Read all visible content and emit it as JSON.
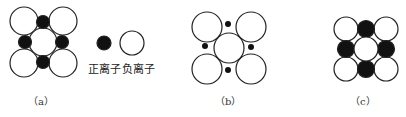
{
  "legend": {
    "cation_label": "正离子",
    "anion_label": "负离子"
  },
  "panels": [
    {
      "id": "a",
      "caption": "（a）",
      "description": "cations touch anions; stable packing"
    },
    {
      "id": "b",
      "caption": "（b）",
      "description": "small cations not touching anions; unstable"
    },
    {
      "id": "c",
      "caption": "（c）",
      "description": "cations large, anions not touching; stable"
    }
  ],
  "colors": {
    "cation_fill": "#111111",
    "anion_fill": "#ffffff",
    "outline": "#222222"
  }
}
